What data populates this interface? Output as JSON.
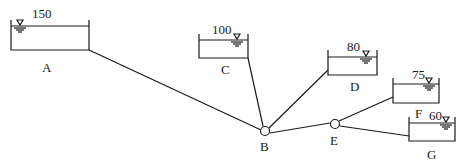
{
  "diagram": {
    "type": "reservoir-pipe-network",
    "colors": {
      "line": "#1a1a1a",
      "background": "#ffffff"
    },
    "reservoirs": [
      {
        "id": "A",
        "label": "A",
        "level": "150"
      },
      {
        "id": "C",
        "label": "C",
        "level": "100"
      },
      {
        "id": "D",
        "label": "D",
        "level": "80"
      },
      {
        "id": "F",
        "label": "F",
        "level": "75"
      },
      {
        "id": "G",
        "label": "G",
        "level": "60"
      }
    ],
    "junctions": [
      {
        "id": "B",
        "label": "B"
      },
      {
        "id": "E",
        "label": "E"
      }
    ],
    "pipes": [
      {
        "from": "A",
        "to": "B"
      },
      {
        "from": "C",
        "to": "B"
      },
      {
        "from": "D",
        "to": "B"
      },
      {
        "from": "B",
        "to": "E"
      },
      {
        "from": "E",
        "to": "F"
      },
      {
        "from": "E",
        "to": "G"
      }
    ],
    "water_level_symbol": "inverted-triangle"
  }
}
